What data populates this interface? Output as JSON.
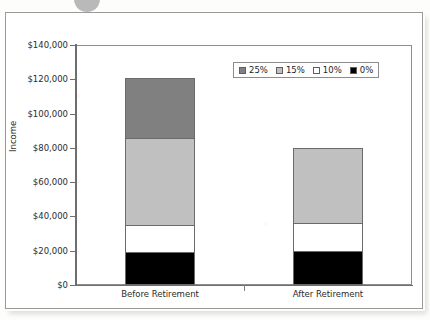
{
  "chart_data": {
    "type": "bar",
    "stacked": true,
    "title": "",
    "xlabel": "",
    "ylabel": "Income",
    "categories": [
      "Before Retirement",
      "After Retirement"
    ],
    "ylim": [
      0,
      140000
    ],
    "ytick_step": 20000,
    "ytick_labels": [
      "$0",
      "$20,000",
      "$40,000",
      "$60,000",
      "$80,000",
      "$100,000",
      "$120,000",
      "$140,000"
    ],
    "ytick_values": [
      0,
      20000,
      40000,
      60000,
      80000,
      100000,
      120000,
      140000
    ],
    "grid": false,
    "legend_position": "upper right",
    "series": [
      {
        "name": "0%",
        "color": "#000000",
        "values": [
          19000,
          20000
        ]
      },
      {
        "name": "10%",
        "color": "#ffffff",
        "values": [
          16000,
          16000
        ]
      },
      {
        "name": "15%",
        "color": "#c0c0c0",
        "values": [
          51000,
          44000
        ]
      },
      {
        "name": "25%",
        "color": "#808080",
        "values": [
          35000,
          0
        ]
      }
    ],
    "stack_totals": [
      121000,
      80000
    ]
  },
  "legend": {
    "items": [
      {
        "label": "25%",
        "color": "#808080"
      },
      {
        "label": "15%",
        "color": "#c0c0c0"
      },
      {
        "label": "10%",
        "color": "#ffffff"
      },
      {
        "label": "0%",
        "color": "#000000"
      }
    ]
  },
  "axes": {
    "y_title": "Income",
    "y_ticks": [
      "$140,000",
      "$120,000",
      "$100,000",
      "$80,000",
      "$60,000",
      "$40,000",
      "$20,000",
      "$0"
    ],
    "x_categories": [
      "Before Retirement",
      "After Retirement"
    ]
  }
}
